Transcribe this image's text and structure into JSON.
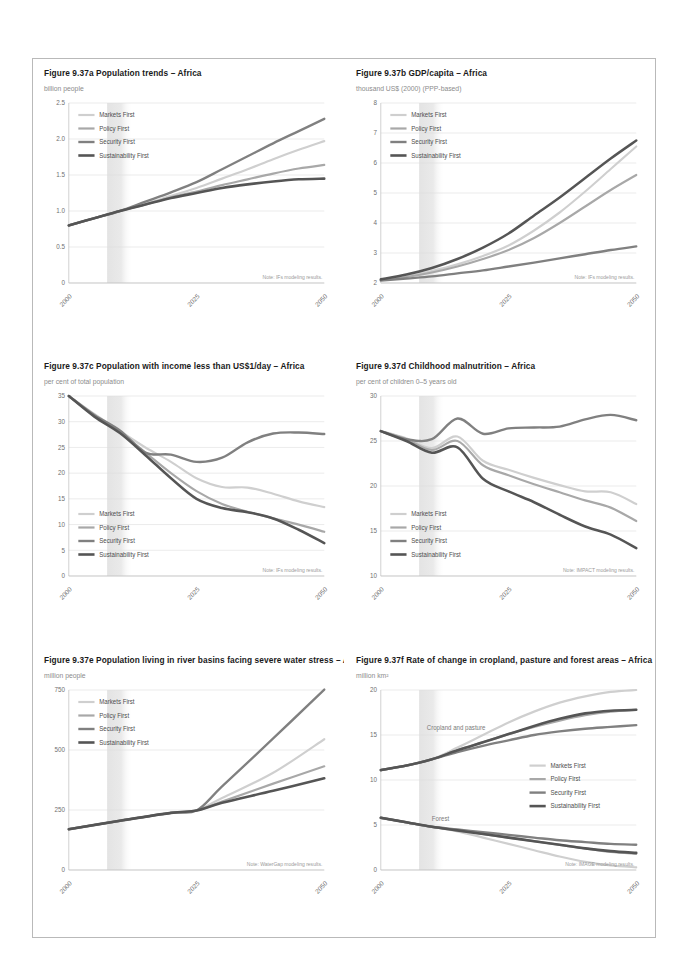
{
  "document": {
    "page_background": "#ffffff",
    "border_color": "#b9b9b9"
  },
  "series_styles": [
    {
      "name": "Markets First",
      "color": "#cfcfcf",
      "width": 2.2
    },
    {
      "name": "Policy First",
      "color": "#a8a8a8",
      "width": 2.2
    },
    {
      "name": "Security First",
      "color": "#808080",
      "width": 2.4
    },
    {
      "name": "Sustainability First",
      "color": "#555555",
      "width": 2.6
    }
  ],
  "legend_labels": [
    "Markets First",
    "Policy First",
    "Security First",
    "Sustainability First"
  ],
  "panels": [
    {
      "id": "a",
      "title": "Figure 9.37a Population trends – Africa",
      "subtitle": "billion people",
      "note": "Note: IFs modeling results.",
      "legend_position": "top-left",
      "chart_data": {
        "type": "line",
        "title": "Figure 9.37a Population trends – Africa",
        "xlabel": "",
        "ylabel": "billion people",
        "xlim": [
          2000,
          2050
        ],
        "ylim": [
          0,
          2.5
        ],
        "yticks": [
          0,
          0.5,
          1.0,
          1.5,
          2.0,
          2.5
        ],
        "ytick_labels": [
          "0",
          "0.5",
          "1.0",
          "1.5",
          "2.0",
          "2.5"
        ],
        "xticks": [
          2000,
          2025,
          2050
        ],
        "xtick_labels": [
          "2000",
          "2025",
          "2050"
        ],
        "grid": true,
        "legend": [
          "Markets First",
          "Policy First",
          "Security First",
          "Sustainability First"
        ],
        "x": [
          2000,
          2005,
          2010,
          2015,
          2020,
          2025,
          2030,
          2035,
          2040,
          2045,
          2050
        ],
        "series": [
          {
            "name": "Markets First",
            "values": [
              0.8,
              0.9,
              1.0,
              1.1,
              1.21,
              1.32,
              1.45,
              1.58,
              1.72,
              1.85,
              1.97
            ]
          },
          {
            "name": "Policy First",
            "values": [
              0.8,
              0.9,
              1.0,
              1.09,
              1.19,
              1.27,
              1.36,
              1.44,
              1.52,
              1.59,
              1.64
            ]
          },
          {
            "name": "Security First",
            "values": [
              0.8,
              0.9,
              1.0,
              1.13,
              1.26,
              1.4,
              1.58,
              1.76,
              1.94,
              2.11,
              2.28
            ]
          },
          {
            "name": "Sustainability First",
            "values": [
              0.8,
              0.9,
              1.0,
              1.09,
              1.18,
              1.25,
              1.32,
              1.37,
              1.41,
              1.44,
              1.45
            ]
          }
        ]
      }
    },
    {
      "id": "b",
      "title": "Figure 9.37b GDP/capita – Africa",
      "subtitle": "thousand US$ (2000) (PPP-based)",
      "note": "Note: IFs modeling results.",
      "legend_position": "top-left",
      "chart_data": {
        "type": "line",
        "title": "Figure 9.37b GDP/capita – Africa",
        "xlabel": "",
        "ylabel": "thousand US$ (2000) (PPP-based)",
        "xlim": [
          2000,
          2050
        ],
        "ylim": [
          2,
          8
        ],
        "yticks": [
          2,
          3,
          4,
          5,
          6,
          7,
          8
        ],
        "ytick_labels": [
          "2",
          "3",
          "4",
          "5",
          "6",
          "7",
          "8"
        ],
        "xticks": [
          2000,
          2025,
          2050
        ],
        "xtick_labels": [
          "2000",
          "2025",
          "2050"
        ],
        "grid": true,
        "legend": [
          "Markets First",
          "Policy First",
          "Security First",
          "Sustainability First"
        ],
        "x": [
          2000,
          2005,
          2010,
          2015,
          2020,
          2025,
          2030,
          2035,
          2040,
          2045,
          2050
        ],
        "series": [
          {
            "name": "Markets First",
            "values": [
              2.1,
              2.22,
              2.4,
              2.62,
              2.9,
              3.25,
              3.75,
              4.35,
              5.05,
              5.8,
              6.55
            ]
          },
          {
            "name": "Policy First",
            "values": [
              2.1,
              2.2,
              2.35,
              2.55,
              2.8,
              3.1,
              3.5,
              4.0,
              4.55,
              5.1,
              5.6
            ]
          },
          {
            "name": "Security First",
            "values": [
              2.08,
              2.15,
              2.22,
              2.32,
              2.42,
              2.55,
              2.68,
              2.82,
              2.96,
              3.1,
              3.22
            ]
          },
          {
            "name": "Sustainability First",
            "values": [
              2.12,
              2.28,
              2.5,
              2.8,
              3.18,
              3.65,
              4.25,
              4.85,
              5.5,
              6.15,
              6.75
            ]
          }
        ]
      }
    },
    {
      "id": "c",
      "title": "Figure 9.37c Population with income less than US$1/day – Africa",
      "subtitle": "per cent of total population",
      "note": "Note: IFs modeling results.",
      "legend_position": "bottom-left",
      "chart_data": {
        "type": "line",
        "title": "Figure 9.37c Population with income less than US$1/day – Africa",
        "xlabel": "",
        "ylabel": "per cent of total population",
        "xlim": [
          2000,
          2050
        ],
        "ylim": [
          0,
          35
        ],
        "yticks": [
          0,
          5,
          10,
          15,
          20,
          25,
          30,
          35
        ],
        "ytick_labels": [
          "0",
          "5",
          "10",
          "15",
          "20",
          "25",
          "30",
          "35"
        ],
        "xticks": [
          2000,
          2025,
          2050
        ],
        "xtick_labels": [
          "2000",
          "2025",
          "2050"
        ],
        "grid": true,
        "legend": [
          "Markets First",
          "Policy First",
          "Security First",
          "Sustainability First"
        ],
        "x": [
          2000,
          2005,
          2010,
          2015,
          2020,
          2025,
          2030,
          2035,
          2040,
          2045,
          2050
        ],
        "series": [
          {
            "name": "Markets First",
            "values": [
              35.0,
              31.5,
              28.2,
              25.0,
              22.2,
              19.0,
              17.3,
              17.2,
              16.0,
              14.5,
              13.4
            ]
          },
          {
            "name": "Policy First",
            "values": [
              35.0,
              31.2,
              28.0,
              24.0,
              20.0,
              16.5,
              14.0,
              12.5,
              11.2,
              10.0,
              8.6
            ]
          },
          {
            "name": "Security First",
            "values": [
              35.0,
              31.3,
              28.3,
              24.0,
              23.6,
              22.2,
              23.0,
              26.0,
              27.7,
              27.9,
              27.6
            ]
          },
          {
            "name": "Sustainability First",
            "values": [
              35.0,
              31.0,
              27.8,
              23.5,
              19.0,
              15.0,
              13.2,
              12.4,
              11.2,
              9.0,
              6.4
            ]
          }
        ]
      }
    },
    {
      "id": "d",
      "title": "Figure 9.37d Childhood malnutrition – Africa",
      "subtitle": "per cent of children 0–5 years old",
      "note": "Note: IMPACT modeling results.",
      "legend_position": "bottom-left",
      "chart_data": {
        "type": "line",
        "title": "Figure 9.37d Childhood malnutrition – Africa",
        "xlabel": "",
        "ylabel": "per cent of children 0–5 years old",
        "xlim": [
          2000,
          2050
        ],
        "ylim": [
          10,
          30
        ],
        "yticks": [
          10,
          15,
          20,
          25,
          30
        ],
        "ytick_labels": [
          "10",
          "15",
          "20",
          "25",
          "30"
        ],
        "xticks": [
          2000,
          2025,
          2050
        ],
        "xtick_labels": [
          "2000",
          "2025",
          "2050"
        ],
        "grid": true,
        "legend": [
          "Markets First",
          "Policy First",
          "Security First",
          "Sustainability First"
        ],
        "x": [
          2000,
          2005,
          2010,
          2015,
          2020,
          2025,
          2030,
          2035,
          2040,
          2045,
          2050
        ],
        "series": [
          {
            "name": "Markets First",
            "values": [
              26.1,
              25.3,
              24.2,
              25.5,
              22.8,
              21.8,
              20.9,
              20.1,
              19.4,
              19.3,
              18.0
            ]
          },
          {
            "name": "Policy First",
            "values": [
              26.1,
              25.2,
              24.0,
              25.0,
              22.3,
              21.2,
              20.2,
              19.3,
              18.4,
              17.6,
              16.1
            ]
          },
          {
            "name": "Security First",
            "values": [
              26.1,
              25.2,
              25.2,
              27.5,
              25.8,
              26.4,
              26.5,
              26.6,
              27.4,
              27.9,
              27.3
            ]
          },
          {
            "name": "Sustainability First",
            "values": [
              26.1,
              25.0,
              23.7,
              24.3,
              20.8,
              19.4,
              18.2,
              16.8,
              15.5,
              14.6,
              13.1
            ]
          }
        ]
      }
    },
    {
      "id": "e",
      "title": "Figure 9.37e Population living in river basins facing severe water stress – Africa",
      "subtitle": "million people",
      "note": "Note: WaterGap modeling results.",
      "legend_position": "top-left",
      "chart_data": {
        "type": "line",
        "title": "Figure 9.37e Population living in river basins facing severe water stress – Africa",
        "xlabel": "",
        "ylabel": "million people",
        "xlim": [
          2000,
          2050
        ],
        "ylim": [
          0,
          750
        ],
        "yticks": [
          0,
          250,
          500,
          750
        ],
        "ytick_labels": [
          "0",
          "250",
          "500",
          "750"
        ],
        "xticks": [
          2000,
          2025,
          2050
        ],
        "xtick_labels": [
          "2000",
          "2025",
          "2050"
        ],
        "grid": true,
        "legend": [
          "Markets First",
          "Policy First",
          "Security First",
          "Sustainability First"
        ],
        "x": [
          2000,
          2010,
          2020,
          2025,
          2030,
          2040,
          2050
        ],
        "series": [
          {
            "name": "Markets First",
            "values": [
              170,
              205,
              238,
              248,
              300,
              405,
              545
            ]
          },
          {
            "name": "Policy First",
            "values": [
              170,
              205,
              238,
              248,
              285,
              360,
              432
            ]
          },
          {
            "name": "Security First",
            "values": [
              170,
              205,
              238,
              248,
              348,
              548,
              752
            ]
          },
          {
            "name": "Sustainability First",
            "values": [
              170,
              205,
              238,
              248,
              280,
              330,
              382
            ]
          }
        ]
      }
    },
    {
      "id": "f",
      "title": "Figure 9.37f Rate of change in cropland, pasture and forest areas – Africa",
      "subtitle": "million km²",
      "note": "Note: IMAGE modeling results.",
      "legend_position": "middle-right",
      "inline_labels": [
        {
          "text": "Cropland and pasture",
          "x": 2009,
          "y": 15.6
        },
        {
          "text": "Forest",
          "x": 2010,
          "y": 5.4
        }
      ],
      "chart_data": {
        "type": "line",
        "title": "Figure 9.37f Rate of change in cropland, pasture and forest areas – Africa",
        "xlabel": "",
        "ylabel": "million km²",
        "xlim": [
          2000,
          2050
        ],
        "ylim": [
          0,
          20
        ],
        "yticks": [
          0,
          5,
          10,
          15,
          20
        ],
        "ytick_labels": [
          "0",
          "5",
          "10",
          "15",
          "20"
        ],
        "xticks": [
          2000,
          2025,
          2050
        ],
        "xtick_labels": [
          "2000",
          "2025",
          "2050"
        ],
        "grid": true,
        "legend": [
          "Markets First",
          "Policy First",
          "Security First",
          "Sustainability First"
        ],
        "x": [
          2000,
          2005,
          2010,
          2015,
          2020,
          2025,
          2030,
          2035,
          2040,
          2045,
          2050
        ],
        "groups": [
          {
            "group": "Cropland and pasture",
            "series": [
              {
                "name": "Markets First",
                "values": [
                  11.1,
                  11.6,
                  12.3,
                  13.6,
                  15.0,
                  16.4,
                  17.6,
                  18.6,
                  19.3,
                  19.8,
                  20.0
                ]
              },
              {
                "name": "Policy First",
                "values": [
                  11.1,
                  11.6,
                  12.3,
                  13.3,
                  14.2,
                  15.1,
                  15.9,
                  16.6,
                  17.2,
                  17.6,
                  17.8
                ]
              },
              {
                "name": "Security First",
                "values": [
                  11.1,
                  11.6,
                  12.3,
                  13.1,
                  13.8,
                  14.4,
                  15.0,
                  15.4,
                  15.7,
                  15.9,
                  16.1
                ]
              },
              {
                "name": "Sustainability First",
                "values": [
                  11.1,
                  11.6,
                  12.3,
                  13.3,
                  14.2,
                  15.1,
                  16.0,
                  16.8,
                  17.4,
                  17.7,
                  17.8
                ]
              }
            ]
          },
          {
            "group": "Forest",
            "series": [
              {
                "name": "Markets First",
                "values": [
                  5.8,
                  5.3,
                  4.8,
                  4.3,
                  3.6,
                  2.9,
                  2.2,
                  1.5,
                  0.9,
                  0.5,
                  0.3
                ]
              },
              {
                "name": "Policy First",
                "values": [
                  5.8,
                  5.3,
                  4.8,
                  4.4,
                  4.0,
                  3.6,
                  3.2,
                  2.8,
                  2.4,
                  2.0,
                  1.8
                ]
              },
              {
                "name": "Security First",
                "values": [
                  5.8,
                  5.3,
                  4.8,
                  4.5,
                  4.2,
                  3.9,
                  3.6,
                  3.3,
                  3.1,
                  2.9,
                  2.8
                ]
              },
              {
                "name": "Sustainability First",
                "values": [
                  5.8,
                  5.3,
                  4.8,
                  4.4,
                  4.0,
                  3.6,
                  3.2,
                  2.8,
                  2.4,
                  2.1,
                  1.9
                ]
              }
            ]
          }
        ]
      }
    }
  ]
}
